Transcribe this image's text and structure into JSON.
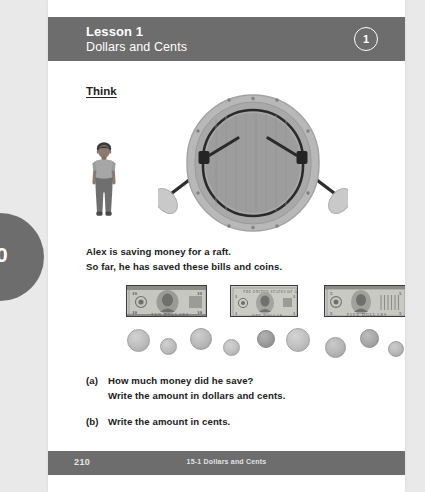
{
  "page": {
    "side_tab_number": "210",
    "background_color": "#e9e9e9",
    "sheet_color": "#ffffff",
    "accent_gray": "#6d6d6d"
  },
  "header": {
    "lesson_title": "Lesson 1",
    "lesson_subtitle": "Dollars and Cents",
    "badge_number": "1"
  },
  "main": {
    "section_heading": "Think",
    "prompt_lines": [
      "Alex is saving money for a raft.",
      "So far, he has saved these bills and coins."
    ],
    "questions": [
      {
        "marker": "(a)",
        "lines": [
          "How much money did he save?",
          "Write the amount in dollars and cents."
        ]
      },
      {
        "marker": "(b)",
        "lines": [
          "Write the amount in cents."
        ]
      }
    ]
  },
  "illustration": {
    "boy_label": "boy-figure",
    "raft_label": "inflatable-raft-with-oars"
  },
  "money": {
    "bills": [
      {
        "name": "ten-dollar-bill",
        "denomination": "10",
        "left": 78,
        "width": 81
      },
      {
        "name": "one-dollar-bill",
        "denomination": "1",
        "left": 182,
        "width": 68
      },
      {
        "name": "five-dollar-bill",
        "denomination": "5",
        "left": 276,
        "width": 82
      }
    ],
    "coins": [
      {
        "name": "coin-1",
        "left": 79,
        "top": 2,
        "size": 21,
        "shade": "#bdbdbd"
      },
      {
        "name": "coin-2",
        "left": 112,
        "top": 11,
        "size": 15,
        "shade": "#bcbcbc"
      },
      {
        "name": "coin-3",
        "left": 142,
        "top": 1,
        "size": 20,
        "shade": "#b9b9b9"
      },
      {
        "name": "coin-4",
        "left": 175,
        "top": 12,
        "size": 15,
        "shade": "#bfbfbf"
      },
      {
        "name": "coin-5",
        "left": 209,
        "top": 3,
        "size": 16,
        "shade": "#9b9b9b"
      },
      {
        "name": "coin-6",
        "left": 238,
        "top": 1,
        "size": 22,
        "shade": "#c0c0c0"
      },
      {
        "name": "coin-7",
        "left": 277,
        "top": 10,
        "size": 19,
        "shade": "#b6b6b6"
      },
      {
        "name": "coin-8",
        "left": 312,
        "top": 2,
        "size": 17,
        "shade": "#a8a8a8"
      },
      {
        "name": "coin-9",
        "left": 340,
        "top": 14,
        "size": 14,
        "shade": "#b8b8b8"
      }
    ]
  },
  "footer": {
    "page_number": "210",
    "center_label": "15-1 Dollars and Cents"
  }
}
